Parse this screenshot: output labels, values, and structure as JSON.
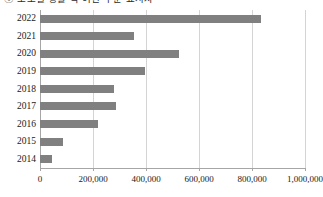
{
  "chart_data": {
    "type": "bar",
    "orientation": "horizontal",
    "title": "ⓒ 도로별 생활 각 여건 수준 표시자",
    "xlabel": "",
    "ylabel": "",
    "categories": [
      "2022",
      "2021",
      "2020",
      "2019",
      "2018",
      "2017",
      "2016",
      "2015",
      "2014"
    ],
    "values": [
      835000,
      355000,
      525000,
      396000,
      280000,
      287000,
      219000,
      87000,
      45000
    ],
    "xlim": [
      0,
      1000000
    ],
    "xticks": [
      0,
      200000,
      400000,
      600000,
      800000,
      1000000
    ],
    "xtick_labels": [
      "0",
      "200,000",
      "400,000",
      "600,000",
      "800,000",
      "1,000,000"
    ],
    "grid": true,
    "grid_axis": "x",
    "legend": false,
    "bar_color": "#808080",
    "gridline_color": "#d4d4d4",
    "axis_color": "#a6a6a6"
  }
}
